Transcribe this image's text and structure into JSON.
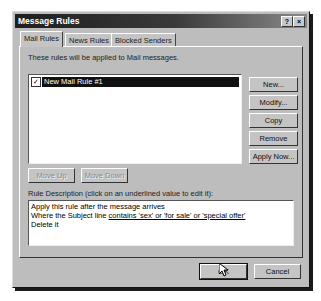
{
  "window": {
    "title": "Message Rules",
    "help_button": "?",
    "close_button": "×"
  },
  "tabs": [
    {
      "label": "Mail Rules",
      "active": true
    },
    {
      "label": "News Rules",
      "active": false
    },
    {
      "label": "Blocked Senders",
      "active": false
    }
  ],
  "mail_rules": {
    "intro_text": "These rules will be applied to Mail messages.",
    "rules": [
      {
        "label": "New Mail Rule #1",
        "checked": true,
        "selected": true
      }
    ],
    "side_buttons": {
      "new": "New...",
      "modify": "Modify...",
      "copy": "Copy",
      "remove": "Remove",
      "apply_now": "Apply Now..."
    },
    "move_up": "Move Up",
    "move_down": "Move Down",
    "description_label": "Rule Description (click on an underlined value to edit it):",
    "description": {
      "line1": "Apply this rule after the message arrives",
      "line2_prefix": "Where the Subject line ",
      "line2_link": "contains 'sex' or 'for sale' or 'special offer'",
      "line3": "Delete it"
    }
  },
  "footer": {
    "ok": "OK",
    "cancel": "Cancel"
  }
}
